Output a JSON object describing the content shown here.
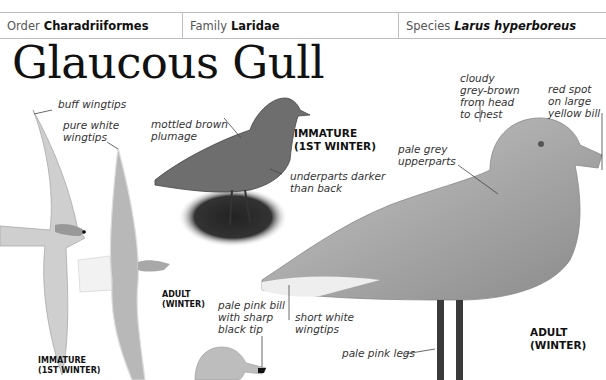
{
  "header_strip": "Laridae, Charadriiformes",
  "taxonomy": {
    "order": {
      "label": "Order",
      "value": "Charadriiformes"
    },
    "family": {
      "label": "Family",
      "value": "Laridae"
    },
    "species": {
      "label": "Species",
      "value": "Larus hyperboreus"
    }
  },
  "title": "Glaucous Gull",
  "annotations": {
    "buff_wingtips": "buff wingtips",
    "pure_white_wingtips": "pure white wingtips",
    "mottled_brown_plumage": "mottled brown plumage",
    "underparts_darker": "underparts darker than back",
    "cloudy_grey_brown": "cloudy grey-brown from head to chest",
    "red_spot_bill": "red spot on large yellow bill",
    "pale_grey_upperparts": "pale grey upperparts",
    "pale_pink_bill": "pale pink bill with sharp black tip",
    "short_white_wingtips": "short white wingtips",
    "pale_pink_legs": "pale pink legs"
  },
  "tags": {
    "immature_flight": [
      "IMMATURE",
      "(1ST WINTER)"
    ],
    "adult_flight": [
      "ADULT",
      "(WINTER)"
    ],
    "immature_standing": [
      "IMMATURE",
      "(1ST WINTER)"
    ],
    "adult_standing": [
      "ADULT",
      "(WINTER)"
    ]
  },
  "colors": {
    "border": "#bdbdbd",
    "text": "#222222",
    "bird_grey": "#9a9a9a"
  }
}
